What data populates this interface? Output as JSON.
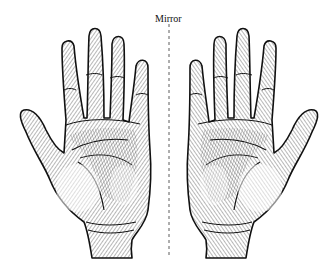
{
  "figure": {
    "mirror_label": "Mirror",
    "axis": {
      "x": 169,
      "y_start": 24,
      "y_end": 258,
      "style": "dashed"
    },
    "left_hand": {
      "description": "left palm facing viewer, thumb on left"
    },
    "right_hand": {
      "description": "mirror image of left palm, thumb on right"
    },
    "colors": {
      "ink": "#111111",
      "background": "#ffffff"
    }
  }
}
